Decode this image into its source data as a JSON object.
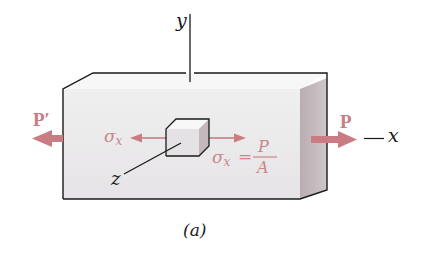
{
  "diagram": {
    "axes": {
      "y_label": "y",
      "x_label": "x",
      "z_label": "z"
    },
    "forces": {
      "left_label": "P′",
      "right_label": "P"
    },
    "stress": {
      "symbol": "σ",
      "subscript": "x",
      "equation_lhs_symbol": "σ",
      "equation_lhs_subscript": "x",
      "equals": "=",
      "numerator": "P",
      "denominator": "A"
    },
    "caption": "(a)",
    "colors": {
      "force_arrow": "#c97d82",
      "stress_text": "#c9868a",
      "box_front": "#ecebec",
      "box_top": "#f6f6f7",
      "box_side": "#bfb3b8",
      "outline": "#1a1a1a"
    }
  }
}
